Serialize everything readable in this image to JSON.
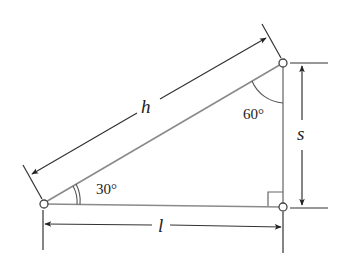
{
  "diagram": {
    "type": "right-triangle",
    "labels": {
      "hypotenuse": "h",
      "vertical_side": "s",
      "base": "l",
      "angle_bottom_left": "30°",
      "angle_top_right": "60°"
    },
    "colors": {
      "line": "#8a8a8a",
      "dim": "#333333",
      "text": "#222222"
    }
  }
}
